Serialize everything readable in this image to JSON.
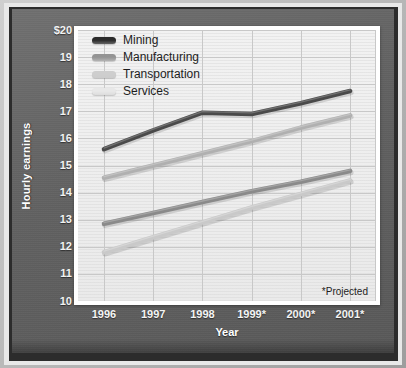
{
  "chart_data": {
    "type": "line",
    "title": "",
    "xlabel": "Year",
    "ylabel": "Hourly earnings",
    "categories": [
      "1996",
      "1997",
      "1998",
      "1999*",
      "2000*",
      "2001*"
    ],
    "x": [
      1996,
      1997,
      1998,
      1999,
      2000,
      2001
    ],
    "ylim": [
      10,
      20
    ],
    "ytick_labels": [
      "$20",
      "19",
      "18",
      "17",
      "16",
      "15",
      "14",
      "13",
      "12",
      "11",
      "10"
    ],
    "ytick_values": [
      20,
      19,
      18,
      17,
      16,
      15,
      14,
      13,
      12,
      11,
      10
    ],
    "grid": true,
    "legend_position": "top-left",
    "annotation": "*Projected",
    "series": [
      {
        "name": "Mining",
        "color": "#4a4a4a",
        "values": [
          15.6,
          16.3,
          16.95,
          16.9,
          17.3,
          17.75
        ]
      },
      {
        "name": "Manufacturing",
        "color": "#8a8a8a",
        "values": [
          12.85,
          13.25,
          13.65,
          14.05,
          14.4,
          14.8
        ]
      },
      {
        "name": "Transportation",
        "color": "#b0b0b0",
        "values": [
          14.55,
          15.0,
          15.45,
          15.9,
          16.4,
          16.85
        ]
      },
      {
        "name": "Services",
        "color": "#c9c9c9",
        "values": [
          11.8,
          12.35,
          12.9,
          13.45,
          13.95,
          14.45
        ]
      }
    ]
  },
  "axes": {
    "y_label": "Hourly earnings",
    "x_label": "Year"
  },
  "note": {
    "projected": "*Projected"
  },
  "colors": {
    "panel_background": "#5f5f5f",
    "plot_background": "#eeeeee",
    "grid": "#c8c8c8",
    "tick_text": "#f2f2f2",
    "legend_text": "#1d1d1d",
    "mining": "#4a4a4a",
    "manufacturing": "#8a8a8a",
    "transportation": "#b0b0b0",
    "services": "#c9c9c9"
  }
}
